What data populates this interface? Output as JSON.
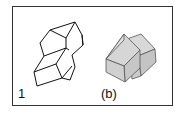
{
  "figure": {
    "labels": {
      "left": "1",
      "right": "(b)"
    },
    "colors": {
      "frame": "#333333",
      "line": "#111111",
      "shaded_light": "#d8d8d8",
      "shaded_dark": "#bdbdbd",
      "edge_gray": "#555555"
    },
    "panels": [
      {
        "id": "wireframe",
        "description": "line-drawn stepped block composed of two offset cubes"
      },
      {
        "id": "shaded",
        "description": "gray shaded solid made of two offset cubes viewed from another angle"
      }
    ]
  }
}
